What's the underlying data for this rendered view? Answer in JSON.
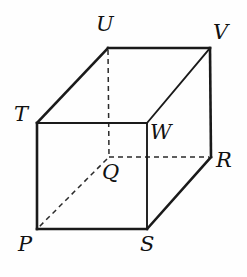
{
  "figure": {
    "type": "geometry-solid",
    "background_color": "#fefefe",
    "stroke_color": "#1a1a1a",
    "hidden_stroke_color": "#2a2a2a",
    "width": 247,
    "height": 277
  },
  "vertices": [
    {
      "id": "U",
      "label": "U",
      "x": 108,
      "y": 48,
      "label_x": 96,
      "label_y": 14,
      "position": "back-top-left"
    },
    {
      "id": "V",
      "label": "V",
      "x": 210,
      "y": 48,
      "label_x": 213,
      "label_y": 22,
      "position": "back-top-right"
    },
    {
      "id": "T",
      "label": "T",
      "x": 37,
      "y": 123,
      "label_x": 14,
      "label_y": 104,
      "position": "front-top-left"
    },
    {
      "id": "W",
      "label": "W",
      "x": 147,
      "y": 123,
      "label_x": 150,
      "label_y": 122,
      "position": "front-top-right"
    },
    {
      "id": "Q",
      "label": "Q",
      "x": 109,
      "y": 157,
      "label_x": 102,
      "label_y": 162,
      "position": "back-bottom-left"
    },
    {
      "id": "R",
      "label": "R",
      "x": 211,
      "y": 157,
      "label_x": 216,
      "label_y": 150,
      "position": "back-bottom-right"
    },
    {
      "id": "P",
      "label": "P",
      "x": 37,
      "y": 229,
      "label_x": 18,
      "label_y": 234,
      "position": "front-bottom-left"
    },
    {
      "id": "S",
      "label": "S",
      "x": 147,
      "y": 229,
      "label_x": 140,
      "label_y": 234,
      "position": "front-bottom-right"
    }
  ],
  "edges": {
    "visible": [
      {
        "name": "edge-T-W",
        "from": "T",
        "to": "W",
        "x1": 37,
        "y1": 123,
        "x2": 147,
        "y2": 123
      },
      {
        "name": "edge-T-P",
        "from": "T",
        "to": "P",
        "x1": 37,
        "y1": 123,
        "x2": 37,
        "y2": 229
      },
      {
        "name": "edge-P-S",
        "from": "P",
        "to": "S",
        "x1": 37,
        "y1": 229,
        "x2": 147,
        "y2": 229
      },
      {
        "name": "edge-W-S",
        "from": "W",
        "to": "S",
        "x1": 147,
        "y1": 123,
        "x2": 147,
        "y2": 229
      },
      {
        "name": "edge-T-U",
        "from": "T",
        "to": "U",
        "x1": 37,
        "y1": 123,
        "x2": 108,
        "y2": 48
      },
      {
        "name": "edge-U-V",
        "from": "U",
        "to": "V",
        "x1": 108,
        "y1": 48,
        "x2": 210,
        "y2": 48
      },
      {
        "name": "edge-V-R",
        "from": "V",
        "to": "R",
        "x1": 210,
        "y1": 48,
        "x2": 211,
        "y2": 157
      },
      {
        "name": "edge-W-V",
        "from": "W",
        "to": "V",
        "x1": 147,
        "y1": 123,
        "x2": 210,
        "y2": 48
      },
      {
        "name": "edge-S-R",
        "from": "S",
        "to": "R",
        "x1": 147,
        "y1": 229,
        "x2": 211,
        "y2": 157
      }
    ],
    "hidden": [
      {
        "name": "edge-U-Q",
        "from": "U",
        "to": "Q",
        "x1": 108,
        "y1": 50,
        "x2": 109,
        "y2": 157
      },
      {
        "name": "edge-Q-R",
        "from": "Q",
        "to": "R",
        "x1": 109,
        "y1": 157,
        "x2": 209,
        "y2": 157
      },
      {
        "name": "edge-Q-P",
        "from": "Q",
        "to": "P",
        "x1": 107,
        "y1": 159,
        "x2": 39,
        "y2": 227
      }
    ]
  }
}
